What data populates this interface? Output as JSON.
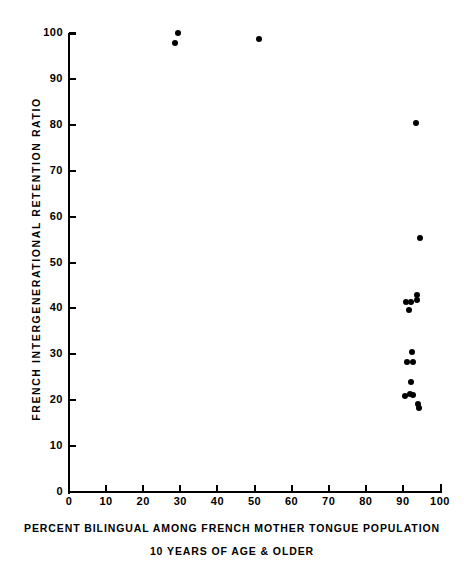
{
  "chart_data": {
    "type": "scatter",
    "title": "",
    "xlabel": "PERCENT BILINGUAL AMONG FRENCH MOTHER TONGUE POPULATION",
    "xlabel_line2": "10 YEARS OF AGE & OLDER",
    "ylabel": "FRENCH INTERGENERATIONAL RETENTION RATIO",
    "xlim": [
      0,
      100
    ],
    "ylim": [
      0,
      100
    ],
    "xticks": [
      0,
      10,
      20,
      30,
      40,
      50,
      60,
      70,
      80,
      90,
      100
    ],
    "yticks": [
      0,
      10,
      20,
      30,
      40,
      50,
      60,
      70,
      80,
      90,
      100
    ],
    "xticklabels": [
      "0",
      "10",
      "20",
      "30",
      "40",
      "50",
      "60",
      "70",
      "80",
      "90",
      "100"
    ],
    "yticklabels": [
      "0",
      "10",
      "20",
      "30",
      "40",
      "50",
      "60",
      "70",
      "80",
      "90",
      "100"
    ],
    "grid": false,
    "legend": false,
    "marker": "filled-circle",
    "marker_color": "#000000",
    "points": [
      {
        "x": 29.4,
        "y": 100.0
      },
      {
        "x": 28.6,
        "y": 97.8
      },
      {
        "x": 51.3,
        "y": 98.7
      },
      {
        "x": 93.5,
        "y": 80.3
      },
      {
        "x": 94.6,
        "y": 55.3
      },
      {
        "x": 93.8,
        "y": 43.0
      },
      {
        "x": 93.8,
        "y": 41.8
      },
      {
        "x": 90.8,
        "y": 41.5
      },
      {
        "x": 92.2,
        "y": 41.3
      },
      {
        "x": 91.7,
        "y": 39.6
      },
      {
        "x": 92.5,
        "y": 30.5
      },
      {
        "x": 91.1,
        "y": 28.3
      },
      {
        "x": 92.7,
        "y": 28.3
      },
      {
        "x": 92.2,
        "y": 24.0
      },
      {
        "x": 90.5,
        "y": 21.0
      },
      {
        "x": 91.9,
        "y": 21.4
      },
      {
        "x": 92.7,
        "y": 21.2
      },
      {
        "x": 94.0,
        "y": 19.2
      },
      {
        "x": 94.3,
        "y": 18.3
      }
    ]
  }
}
